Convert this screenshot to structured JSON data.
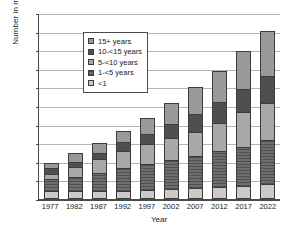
{
  "chart_data": {
    "type": "bar",
    "subtype": "stacked-vertical",
    "title": "",
    "xlabel": "Year",
    "ylabel": "Number in millions",
    "categories": [
      "1977",
      "1982",
      "1987",
      "1992",
      "1997",
      "2002",
      "2007",
      "2012",
      "2017",
      "2022"
    ],
    "ylim": [
      0,
      20
    ],
    "yticks": [
      0,
      2,
      4,
      6,
      8,
      10,
      12,
      14,
      16,
      18,
      20
    ],
    "ytick_labels": [
      "0",
      "2",
      "4",
      "6",
      "8",
      "10",
      "12",
      "14",
      "16",
      "18",
      "20"
    ],
    "grid": true,
    "grid_axis": "y",
    "legend_position": "top-left-inside",
    "stack_order_bottom_to_top": [
      "<1",
      "1-<5",
      "5-<10",
      "10-<15",
      "15+ years"
    ],
    "series": [
      {
        "name": "<1",
        "legend_label": "<1",
        "color": "#c9c9c9",
        "values": [
          0.6,
          0.6,
          0.6,
          0.7,
          0.8,
          0.9,
          1.0,
          1.1,
          1.2,
          1.35
        ]
      },
      {
        "name": "1-<5",
        "legend_label": "1-<5 years",
        "color": "#6e6e6e",
        "values": [
          1.3,
          1.5,
          2.0,
          2.4,
          2.8,
          3.1,
          3.4,
          3.8,
          4.2,
          4.75
        ]
      },
      {
        "name": "5-<10",
        "legend_label": "5-<10 years",
        "color": "#a8a8a8",
        "values": [
          0.6,
          1.1,
          1.5,
          1.8,
          2.1,
          2.4,
          2.6,
          3.1,
          3.7,
          4.0
        ]
      },
      {
        "name": "10-<15",
        "legend_label": "10-<15 years",
        "color": "#4f4f4f",
        "values": [
          0.6,
          0.6,
          0.6,
          1.0,
          1.1,
          1.5,
          1.9,
          2.2,
          2.5,
          2.9
        ]
      },
      {
        "name": "15+ years",
        "legend_label": "15+ years",
        "color": "#999999",
        "values": [
          0.6,
          0.9,
          1.1,
          1.2,
          1.7,
          2.2,
          2.9,
          3.4,
          4.1,
          4.9
        ]
      }
    ],
    "totals": [
      3.7,
      4.7,
      5.8,
      7.1,
      8.5,
      10.1,
      11.8,
      13.6,
      15.7,
      17.9
    ]
  },
  "legend": {
    "items": [
      {
        "label": "15+ years",
        "series": "15+ years"
      },
      {
        "label": "10-<15 years",
        "series": "10-<15"
      },
      {
        "label": "5-<10 years",
        "series": "5-<10"
      },
      {
        "label": "1-<5 years",
        "series": "1-<5"
      },
      {
        "label": "<1",
        "series": "<1"
      }
    ]
  },
  "axes": {
    "y_title": "Number in millions",
    "x_title": "Year"
  }
}
